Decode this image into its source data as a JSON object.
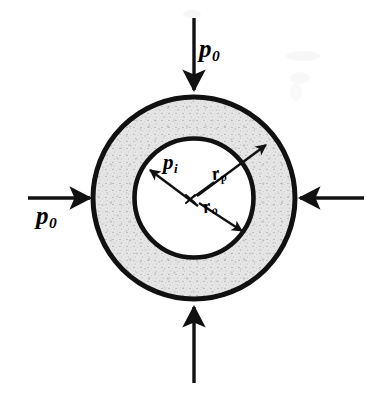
{
  "figure": {
    "kind": "engineering-cross-section-diagram",
    "canvas": {
      "width": 383,
      "height": 397
    },
    "background_color": "#ffffff",
    "ink_color": "#111111",
    "ring_fill_color": "#e3e3e3",
    "bore_fill_color": "#ffffff"
  },
  "geometry": {
    "center": {
      "x": 194,
      "y": 198
    },
    "outer_radius": 103,
    "inner_radius": 59,
    "outer_stroke_width": 5,
    "inner_stroke_width": 4.5
  },
  "pressure_arrows": [
    {
      "name": "top",
      "label": "p",
      "subscript": "0",
      "direction": "down",
      "tail": {
        "x": 194,
        "y": 18
      },
      "head": {
        "x": 194,
        "y": 91
      }
    },
    {
      "name": "left",
      "label": "p",
      "subscript": "0",
      "direction": "right",
      "tail": {
        "x": 28,
        "y": 198
      },
      "head": {
        "x": 91,
        "y": 198
      }
    },
    {
      "name": "right",
      "label": "",
      "subscript": "",
      "direction": "left",
      "tail": {
        "x": 364,
        "y": 198
      },
      "head": {
        "x": 299,
        "y": 198
      }
    },
    {
      "name": "bottom",
      "label": "",
      "subscript": "",
      "direction": "up",
      "tail": {
        "x": 194,
        "y": 383
      },
      "head": {
        "x": 194,
        "y": 306
      }
    }
  ],
  "radial_annotations": [
    {
      "name": "internal-pressure",
      "label": "p",
      "subscript": "i",
      "description": "Internal pressure arrow pointing outward to the bore wall (upper-left)",
      "tail": {
        "x": 196,
        "y": 203
      },
      "head": {
        "x": 147,
        "y": 168
      }
    },
    {
      "name": "outer-radius",
      "label": "r",
      "subscript": "p",
      "description": "Radius arrow from center to the outer wall (upper-right)",
      "tail": {
        "x": 196,
        "y": 196
      },
      "head": {
        "x": 268,
        "y": 143
      }
    },
    {
      "name": "bore-radius",
      "label": "r",
      "subscript": "o",
      "description": "Radius arrow from center to the bore wall (lower-right)",
      "tail": {
        "x": 198,
        "y": 202
      },
      "head": {
        "x": 244,
        "y": 232
      }
    }
  ],
  "center_marker": {
    "name": "center-cross",
    "glyph": "x",
    "x": 190,
    "y": 199,
    "size": 9
  }
}
